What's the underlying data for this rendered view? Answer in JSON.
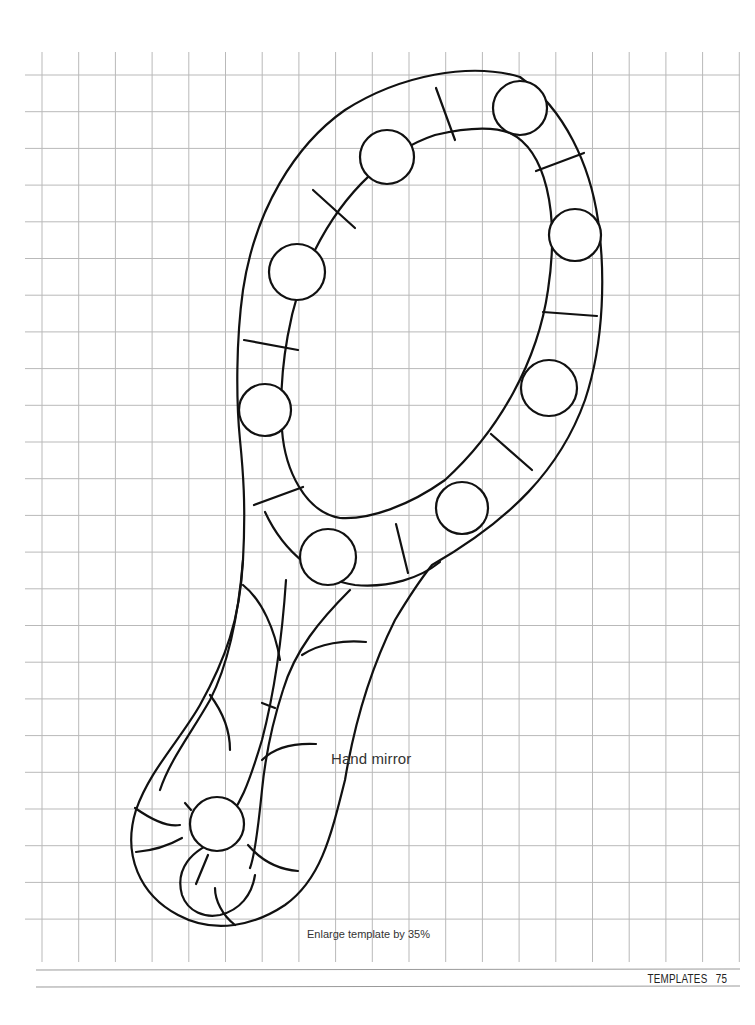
{
  "page": {
    "template_title": "Hand mirror",
    "enlarge_note": "Enlarge template by 35%",
    "footer": {
      "section": "TEMPLATES",
      "page_number": "75"
    }
  },
  "colors": {
    "grid": "#b9b9b9",
    "outline": "#111111",
    "text": "#333333",
    "background": "#ffffff"
  },
  "template": {
    "subject": "hand mirror",
    "jewel_count": 11,
    "grid_unit": "square grid"
  }
}
